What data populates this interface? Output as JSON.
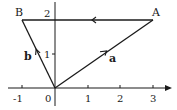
{
  "diagram": {
    "type": "vector-triangle",
    "points": {
      "O": {
        "label": "",
        "x": 0,
        "y": 0
      },
      "A": {
        "label": "A",
        "x": 3,
        "y": 2
      },
      "B": {
        "label": "B",
        "x": -1,
        "y": 2
      }
    },
    "vectors": [
      {
        "name": "a",
        "label": "a",
        "from": "O",
        "to": "A"
      },
      {
        "name": "b",
        "label": "b",
        "from": "O",
        "to": "B"
      },
      {
        "name": "AB",
        "label": "",
        "from": "A",
        "to": "B"
      }
    ],
    "x_axis": {
      "ticks": [
        "-1",
        "0",
        "1",
        "2",
        "3"
      ]
    },
    "y_axis": {
      "ticks": [
        "1",
        "2"
      ]
    },
    "colors": {
      "line": "#1a1a1a",
      "background": "#ffffff"
    }
  }
}
